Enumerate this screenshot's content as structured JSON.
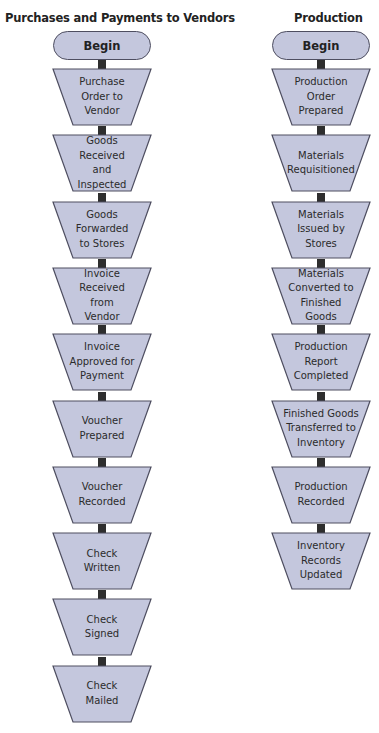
{
  "colors": {
    "shape_fill": "#c4c7dd",
    "shape_border": "#4e4e60",
    "connector": "#2e2e2e"
  },
  "columns": [
    {
      "title": "Purchases and Payments to Vendors",
      "start": "Begin",
      "steps": [
        "Purchase\nOrder to\nVendor",
        "Goods\nReceived\nand\nInspected",
        "Goods\nForwarded\nto Stores",
        "Invoice\nReceived\nfrom\nVendor",
        "Invoice\nApproved for\nPayment",
        "Voucher\nPrepared",
        "Voucher\nRecorded",
        "Check\nWritten",
        "Check\nSigned",
        "Check\nMailed"
      ]
    },
    {
      "title": "Production",
      "start": "Begin",
      "steps": [
        "Production\nOrder\nPrepared",
        "Materials\nRequisitioned",
        "Materials\nIssued by\nStores",
        "Materials\nConverted to\nFinished\nGoods",
        "Production\nReport\nCompleted",
        "Finished Goods\nTransferred to\nInventory",
        "Production\nRecorded",
        "Inventory\nRecords\nUpdated"
      ]
    }
  ]
}
